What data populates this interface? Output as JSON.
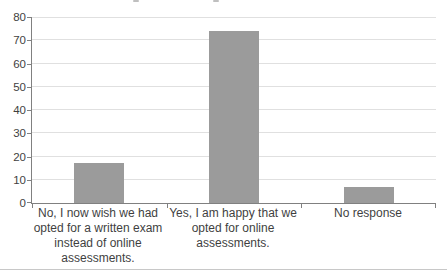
{
  "page": {
    "background": "#ffffff"
  },
  "chart_data": {
    "type": "bar",
    "categories": [
      "No, I now wish we had opted for a written exam instead of online assessments.",
      "Yes, I am happy that we opted for online assessments.",
      "No response"
    ],
    "category_label_lines": [
      [
        "No, I now wish we had",
        "opted for a written exam",
        "instead of online",
        "assessments."
      ],
      [
        "Yes, I am happy that we",
        "opted for online",
        "assessments."
      ],
      [
        "No response"
      ]
    ],
    "values": [
      17,
      74,
      7
    ],
    "title": "",
    "xlabel": "",
    "ylabel": "",
    "ylim": [
      0,
      80
    ],
    "yticks": [
      0,
      10,
      20,
      30,
      40,
      50,
      60,
      70,
      80
    ],
    "grid": true,
    "legend": "none",
    "bar_color": "#9b9b9b",
    "gridline_color": "#e0e0e0",
    "axis_color": "#808080",
    "text_color": "#3f3f3f"
  }
}
